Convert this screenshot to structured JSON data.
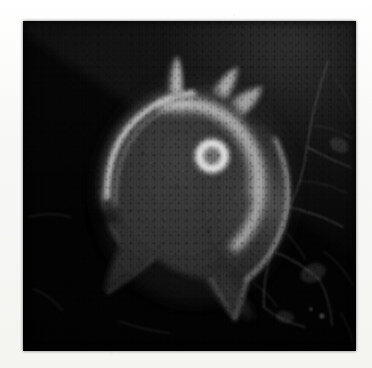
{
  "figure": {
    "kind": "micrograph",
    "modality": "grayscale electron/fluorescence micrograph",
    "alt_text": "Grayscale micrograph of a rounded cell with several finger-like protrusions at the top, a bright ring-shaped organelle near its center-right, and a faint filament network in the dark background at the right.",
    "plate": {
      "x": 23,
      "y": 21,
      "width": 333,
      "height": 330,
      "background_color": "#050505",
      "border_color": "#000000"
    },
    "page": {
      "width": 372,
      "height": 368,
      "margin_color": "#f7f7f5"
    }
  },
  "palette": {
    "paper": "#f7f7f5",
    "background_dark": "#060606",
    "background_band": "#2a2a2a",
    "cell_body": "#3a3a3a",
    "cell_rim": "#cfcfcf",
    "cell_highlight": "#f0f0f0",
    "ring_bright": "#e8e8e8",
    "ring_core": "#6a6a6a",
    "filament": "#5a5a5a"
  },
  "features": [
    {
      "id": "cell-body",
      "name": "cell body",
      "center": [
        186,
        175
      ],
      "size": [
        190,
        215
      ]
    },
    {
      "id": "filopodium-1",
      "name": "central filopodium",
      "tip": [
        175,
        48
      ]
    },
    {
      "id": "filopodium-2",
      "name": "right filopodium upper",
      "tip": [
        246,
        72
      ]
    },
    {
      "id": "filopodium-3",
      "name": "right filopodium lower",
      "tip": [
        272,
        92
      ]
    },
    {
      "id": "nucleus-ring",
      "name": "bright ring organelle",
      "center": [
        212,
        156
      ],
      "outer_radius": 19,
      "inner_radius": 10
    },
    {
      "id": "bright-arc",
      "name": "bright crescent ridge",
      "center": [
        205,
        150
      ],
      "radius": 62
    },
    {
      "id": "leading-edge",
      "name": "bright rim of cell margin"
    },
    {
      "id": "cell-tail",
      "name": "tapering trailing tail",
      "end": [
        250,
        300
      ]
    },
    {
      "id": "filament-network",
      "name": "background filament network",
      "region": "right"
    }
  ],
  "scale_bar": {
    "present": false,
    "label": ""
  },
  "annotations": {
    "labels": [],
    "arrows": []
  }
}
